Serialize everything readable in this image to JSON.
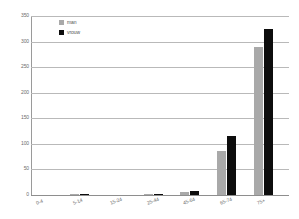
{
  "chart_data": {
    "type": "bar",
    "title": "",
    "subtitle": "",
    "xlabel": "",
    "ylabel": "",
    "categories": [
      "0-4",
      "5-14",
      "15-24",
      "25-44",
      "45-64",
      "65-74",
      "75+"
    ],
    "series": [
      {
        "name": "man",
        "color": "#a9a9a9",
        "values": [
          0,
          2,
          0,
          1,
          6,
          87,
          290
        ]
      },
      {
        "name": "vrouw",
        "color": "#0d0d0d",
        "values": [
          0,
          2,
          0,
          1,
          7,
          115,
          325
        ]
      }
    ],
    "ylim": [
      0,
      350
    ],
    "ytick_values": [
      350,
      300,
      250,
      200,
      150,
      100,
      50,
      0
    ],
    "ytick_labels": [
      "350",
      "300",
      "250",
      "200",
      "150",
      "100",
      "50",
      "0"
    ],
    "grid": "horizontal",
    "legend_position": "top-left",
    "legend": [
      {
        "label": "man",
        "color": "#a9a9a9"
      },
      {
        "label": "vrouw",
        "color": "#0d0d0d"
      }
    ],
    "colors": {
      "gridline": "#b9b9b9",
      "axis": "#9a9a9a",
      "text": "#6d6d6d",
      "background": "#ffffff"
    }
  }
}
